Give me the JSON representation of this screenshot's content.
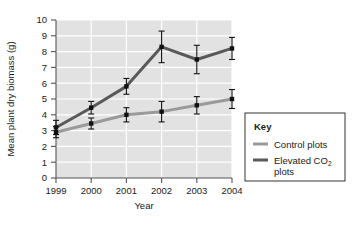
{
  "chart_data": {
    "type": "line",
    "title": "",
    "xlabel": "Year",
    "ylabel": "Mean plant dry biomass (g)",
    "categories": [
      "1999",
      "2000",
      "2001",
      "2002",
      "2003",
      "2004"
    ],
    "x": [
      1999,
      2000,
      2001,
      2002,
      2003,
      2004
    ],
    "ylim": [
      0,
      10
    ],
    "xlim": [
      1999,
      2004
    ],
    "yticks": [
      "0",
      "1",
      "2",
      "3",
      "4",
      "5",
      "6",
      "7",
      "8",
      "9",
      "10"
    ],
    "grid": true,
    "grid_color": "#ffffff",
    "plot_background": "#e2e2e2",
    "legend_position": "right-outside",
    "series": [
      {
        "name": "Control plots",
        "key": "control",
        "color": "#9a9a9a",
        "values": [
          2.9,
          3.45,
          4.0,
          4.2,
          4.6,
          5.0
        ],
        "errors": [
          0.35,
          0.35,
          0.45,
          0.65,
          0.55,
          0.6
        ]
      },
      {
        "name": "Elevated CO2 plots",
        "key": "elevated",
        "color": "#595959",
        "values": [
          3.2,
          4.45,
          5.8,
          8.3,
          7.5,
          8.2
        ],
        "errors": [
          0.45,
          0.4,
          0.5,
          1.0,
          0.9,
          0.7
        ]
      }
    ],
    "marker": "square",
    "marker_color": "#111111",
    "errorbar_color": "#111111"
  },
  "legend": {
    "title": "Key",
    "entries": [
      {
        "label": "Control plots",
        "label_pre": "Control plots",
        "label_sub": "",
        "label_post": "",
        "color": "#9a9a9a"
      },
      {
        "label": "Elevated CO2 plots",
        "label_pre": "Elevated CO",
        "label_sub": "2",
        "label_post": "plots",
        "color": "#595959"
      }
    ]
  },
  "axes": {
    "x_title": "Year",
    "y_title": "Mean plant dry biomass (g)"
  }
}
